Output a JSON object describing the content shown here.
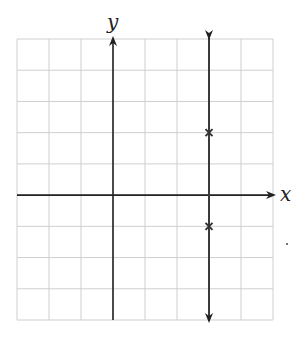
{
  "chart_data": {
    "type": "scatter",
    "title": "",
    "xlabel": "x",
    "ylabel": "y",
    "xlim": [
      -3,
      5
    ],
    "ylim": [
      -4,
      5
    ],
    "grid": true,
    "grid_step": 1,
    "tick_labels": false,
    "vertical_line": {
      "x": 3,
      "arrows": "both"
    },
    "points": [
      {
        "x": 3,
        "y": 2,
        "marker": "x"
      },
      {
        "x": 3,
        "y": -1,
        "marker": "x"
      }
    ]
  },
  "colors": {
    "grid": "#cfcfcf",
    "axis": "#222222",
    "line": "#3a3a3a"
  }
}
